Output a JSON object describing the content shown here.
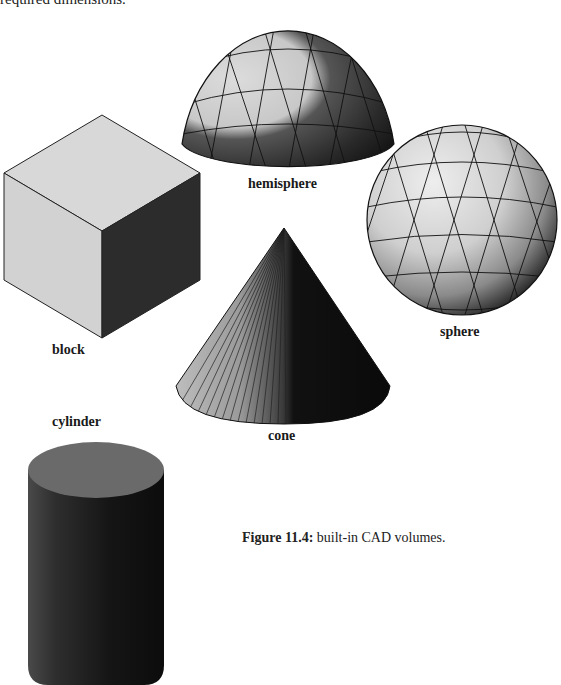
{
  "page": {
    "top_text_fragment": "required dimensions."
  },
  "figure": {
    "shapes": [
      {
        "id": "hemisphere",
        "label": "hemisphere"
      },
      {
        "id": "block",
        "label": "block"
      },
      {
        "id": "sphere",
        "label": "sphere"
      },
      {
        "id": "cone",
        "label": "cone"
      },
      {
        "id": "cylinder",
        "label": "cylinder"
      }
    ],
    "caption": {
      "number": "Figure 11.4:",
      "text": " built-in CAD volumes."
    }
  },
  "colors": {
    "light_face": "#d4d4d4",
    "mid_face": "#8a8a8a",
    "dark_face": "#2a2a2a",
    "edge": "#1a1a1a"
  }
}
